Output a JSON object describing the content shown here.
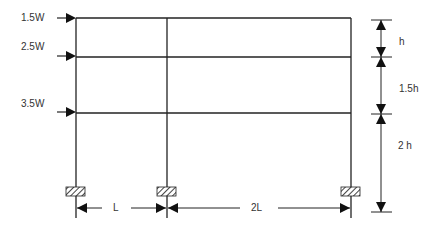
{
  "diagram": {
    "type": "portal-frame",
    "loads": [
      {
        "label": "1.5W",
        "level": "roof"
      },
      {
        "label": "2.5W",
        "level": "second"
      },
      {
        "label": "3.5W",
        "level": "first"
      }
    ],
    "story_heights": [
      {
        "label": "h"
      },
      {
        "label": "1.5h"
      },
      {
        "label": "2 h"
      }
    ],
    "bay_widths": [
      {
        "label": "L"
      },
      {
        "label": "2L"
      }
    ],
    "colors": {
      "line": "#222222",
      "text": "#333333",
      "hatch": "#444444"
    }
  }
}
